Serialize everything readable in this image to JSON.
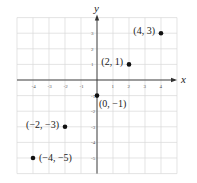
{
  "chart_data": {
    "type": "scatter",
    "title": "",
    "xlabel": "x",
    "ylabel": "y",
    "xlim": [
      -5,
      5
    ],
    "ylim": [
      -6,
      4
    ],
    "grid": true,
    "x_ticks": [
      -4,
      -3,
      -2,
      -1,
      1,
      2,
      3,
      4
    ],
    "y_ticks": [
      3,
      2,
      1,
      -1,
      -2,
      -3,
      -4,
      -5
    ],
    "x_tick_labels": [
      "-4",
      "-3",
      "-2",
      "-1",
      "1",
      "2",
      "3",
      "4"
    ],
    "y_tick_labels": [
      "3",
      "2",
      "1",
      "-1",
      "-2",
      "-3",
      "-4",
      "-5"
    ],
    "points": [
      {
        "x": 4,
        "y": 3,
        "label": "(4, 3)",
        "label_side": "left"
      },
      {
        "x": 2,
        "y": 1,
        "label": "(2, 1)",
        "label_side": "left"
      },
      {
        "x": 0,
        "y": -1,
        "label": "(0, −1)",
        "label_side": "below-right"
      },
      {
        "x": -2,
        "y": -3,
        "label": "(−2, −3)",
        "label_side": "left"
      },
      {
        "x": -4,
        "y": -5,
        "label": "(−4, −5)",
        "label_side": "right"
      }
    ],
    "colors": {
      "grid": "#d8d8d8",
      "axis": "#333333",
      "point": "#111111"
    }
  }
}
